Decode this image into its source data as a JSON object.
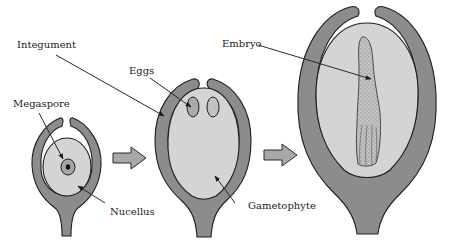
{
  "figure": {
    "type": "diagram",
    "stages": [
      {
        "id": "stage-1",
        "parts": [
          "Integument",
          "Megaspore",
          "Nucellus"
        ]
      },
      {
        "id": "stage-2",
        "parts": [
          "Integument",
          "Eggs",
          "Gametophyte"
        ]
      },
      {
        "id": "stage-3",
        "parts": [
          "Integument",
          "Embryo"
        ]
      }
    ],
    "labels": {
      "integument": "Integument",
      "megaspore": "Megaspore",
      "nucellus": "Nucellus",
      "eggs": "Eggs",
      "gametophyte": "Gametophyte",
      "embryo": "Embryo"
    },
    "colors": {
      "integument": "#8c8c8c",
      "inner_tissue": "#d4d4d4",
      "outline": "#1e1e1e",
      "progress_arrow": "#a8a8a8",
      "background": "#ffffff"
    }
  }
}
